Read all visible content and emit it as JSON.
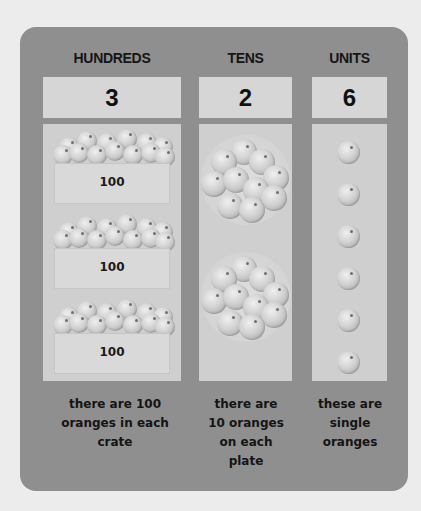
{
  "columns": [
    {
      "header": "HUNDREDS",
      "digit": "3",
      "crates": [
        {
          "label": "100"
        },
        {
          "label": "100"
        },
        {
          "label": "100"
        }
      ],
      "caption_lines": [
        "there are 100",
        "oranges in each",
        "crate"
      ]
    },
    {
      "header": "TENS",
      "digit": "2",
      "plates": [
        {
          "oranges": 10
        },
        {
          "oranges": 10
        }
      ],
      "caption_lines": [
        "there are",
        "10 oranges",
        "on each",
        "plate"
      ]
    },
    {
      "header": "UNITS",
      "digit": "6",
      "single_oranges": 6,
      "caption_lines": [
        "these are",
        "single",
        "oranges"
      ]
    }
  ],
  "colors": {
    "page_background": "#ececec",
    "panel": "#8f8f8f",
    "number_box": "#d6d6d6",
    "content_box": "#cfcfcf",
    "text": "#111111"
  }
}
